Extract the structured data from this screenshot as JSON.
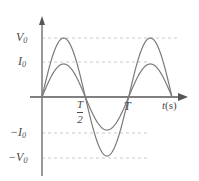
{
  "chart_data": {
    "type": "line",
    "title": "",
    "xlabel": "t(s)",
    "ylabel": "",
    "grid": false,
    "legend_position": "none",
    "xlim": [
      0,
      1.5
    ],
    "ylim": [
      -1,
      1
    ],
    "x_tick_labels": [
      "T/2",
      "T"
    ],
    "x_tick_values": [
      0.5,
      1.0
    ],
    "y_tick_labels": [
      "V0",
      "I0",
      "-I0",
      "-V0"
    ],
    "y_tick_values": [
      1.0,
      0.56,
      -0.56,
      -1.0
    ],
    "series": [
      {
        "name": "voltage",
        "amplitude": 1.0,
        "periods": 1.5,
        "color": "#7a7a7a",
        "values": [
          0,
          0.309,
          0.588,
          0.809,
          0.951,
          1.0,
          0.951,
          0.809,
          0.588,
          0.309,
          0,
          -0.309,
          -0.588,
          -0.809,
          -0.951,
          -1.0,
          -0.951,
          -0.809,
          -0.588,
          -0.309,
          0,
          0.309,
          0.588,
          0.809,
          0.951,
          1.0,
          0.951,
          0.809,
          0.588,
          0.309,
          0
        ]
      },
      {
        "name": "current",
        "amplitude": 0.56,
        "periods": 1.5,
        "color": "#7a7a7a",
        "values": [
          0,
          0.173,
          0.329,
          0.453,
          0.533,
          0.56,
          0.533,
          0.453,
          0.329,
          0.173,
          0,
          -0.173,
          -0.329,
          -0.453,
          -0.533,
          -0.56,
          -0.533,
          -0.453,
          -0.329,
          -0.173,
          0,
          0.173,
          0.329,
          0.453,
          0.533,
          0.56,
          0.533,
          0.453,
          0.329,
          0.173,
          0
        ]
      }
    ],
    "x": [
      0,
      0.05,
      0.1,
      0.15,
      0.2,
      0.25,
      0.3,
      0.35,
      0.4,
      0.45,
      0.5,
      0.55,
      0.6,
      0.65,
      0.7,
      0.75,
      0.8,
      0.85,
      0.9,
      0.95,
      1.0,
      1.05,
      1.1,
      1.15,
      1.2,
      1.25,
      1.3,
      1.35,
      1.4,
      1.45,
      1.5
    ]
  },
  "labels": {
    "v0_main": "V",
    "v0_sub": "0",
    "i0_main": "I",
    "i0_sub": "0",
    "neg_v0_main": "−V",
    "neg_v0_sub": "0",
    "neg_i0_main": "−I",
    "neg_i0_sub": "0",
    "period_half_num": "T",
    "period_half_den": "2",
    "period_full": "T",
    "time_axis_var": "t",
    "time_axis_unit": "(s)"
  },
  "colors": {
    "curve": "#7a7a7a",
    "axis": "#808080",
    "dashed": "#bdbdbd",
    "text": "#4a4a4a",
    "background": "#ffffff"
  }
}
